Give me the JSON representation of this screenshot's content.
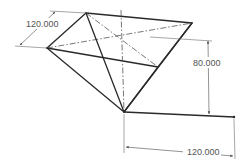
{
  "drawing": {
    "title": "Inverted pyramid sketch with dimensions",
    "dimensions": {
      "top_width": "120.000",
      "height": "80.000",
      "bottom_length": "120.000"
    },
    "colors": {
      "edge": "#2a2a2a",
      "dimension": "#555555",
      "background": "#ffffff"
    }
  }
}
